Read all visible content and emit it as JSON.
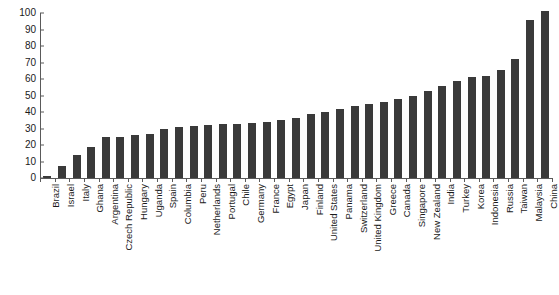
{
  "chart_data": {
    "type": "bar",
    "title": "",
    "subtitle": "",
    "xlabel": "",
    "ylabel": "",
    "ylim": [
      0,
      100
    ],
    "ytick_labels": [
      "0",
      "10",
      "20",
      "30",
      "40",
      "50",
      "60",
      "70",
      "80",
      "90",
      "100"
    ],
    "ytick_values": [
      0,
      10,
      20,
      30,
      40,
      50,
      60,
      70,
      80,
      90,
      100
    ],
    "grid": false,
    "legend": null,
    "bar_color": "#3a3a3a",
    "axis_color": "#5a5a5a",
    "background": "#ffffff",
    "orientation": "vertical",
    "sorted": "ascending",
    "categories": [
      "Brazil",
      "Israel",
      "Italy",
      "Ghana",
      "Argentina",
      "Czech Republic",
      "Hungary",
      "Uganda",
      "Spain",
      "Columbia",
      "Peru",
      "Netherlands",
      "Portugal",
      "Chile",
      "Germany",
      "France",
      "Egypt",
      "Japan",
      "Finland",
      "United States",
      "Panama",
      "Switzerland",
      "United Kingdom",
      "Greece",
      "Canada",
      "Singapore",
      "New Zealand",
      "India",
      "Turkey",
      "Korea",
      "Indonesia",
      "Russia",
      "Taiwan",
      "Malaysia",
      "China"
    ],
    "values": [
      1,
      7,
      14,
      19,
      25,
      25,
      26,
      26.5,
      30,
      31,
      31.5,
      32,
      32.5,
      33,
      33.5,
      34,
      35,
      36.5,
      38.5,
      40,
      42,
      43.5,
      45,
      46,
      48,
      50,
      53,
      56,
      59,
      61,
      62,
      65.5,
      72,
      96,
      101
    ]
  }
}
